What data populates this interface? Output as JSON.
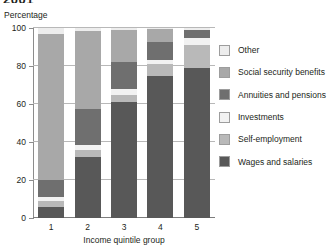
{
  "chart_title": "2001",
  "y_unit_label": "Percentage",
  "x_axis_title": "Income quintile group",
  "y_ticks": [
    "0",
    "20",
    "40",
    "60",
    "80",
    "100"
  ],
  "colors": {
    "wages_and_salaries": "#585858",
    "self_employment": "#b9b9b9",
    "investments": "#f2f2f2",
    "annuities_and_pensions": "#6f6f6f",
    "social_security_benefits": "#a8a8a8",
    "other": "#ededed",
    "gridline": "#b8b8b8",
    "axis": "#8c8c8c",
    "text": "#231f20"
  },
  "legend": {
    "items": [
      {
        "label": "Other",
        "key": "other",
        "color": "#ededed"
      },
      {
        "label": "Social security benefits",
        "key": "social_security_benefits",
        "color": "#a8a8a8"
      },
      {
        "label": "Annuities and pensions",
        "key": "annuities_and_pensions",
        "color": "#6f6f6f"
      },
      {
        "label": "Investments",
        "key": "investments",
        "color": "#f2f2f2"
      },
      {
        "label": "Self-employment",
        "key": "self_employment",
        "color": "#b9b9b9"
      },
      {
        "label": "Wages and salaries",
        "key": "wages_and_salaries",
        "color": "#585858"
      }
    ]
  },
  "chart_data": {
    "type": "bar",
    "subtype": "stacked-100",
    "title": "2001",
    "xlabel": "Income quintile group",
    "ylabel": "Percentage",
    "ylim": [
      0,
      100
    ],
    "yticks": [
      0,
      20,
      40,
      60,
      80,
      100
    ],
    "grid": true,
    "legend_position": "right",
    "categories": [
      "1",
      "2",
      "3",
      "4",
      "5"
    ],
    "series": [
      {
        "name": "Wages and salaries",
        "color": "#585858",
        "values": [
          6,
          32,
          61,
          75,
          79
        ]
      },
      {
        "name": "Self-employment",
        "color": "#b9b9b9",
        "values": [
          3,
          4,
          4,
          6,
          12
        ]
      },
      {
        "name": "Investments",
        "color": "#f2f2f2",
        "values": [
          2,
          2.5,
          3,
          2,
          3.5
        ]
      },
      {
        "name": "Annuities and pensions",
        "color": "#6f6f6f",
        "values": [
          9,
          19,
          14,
          9.5,
          4.5
        ]
      },
      {
        "name": "Social security benefits",
        "color": "#a8a8a8",
        "values": [
          77,
          41,
          17,
          7,
          0
        ]
      },
      {
        "name": "Other",
        "color": "#ededed",
        "values": [
          3,
          1.5,
          1,
          0.5,
          1
        ]
      }
    ]
  }
}
